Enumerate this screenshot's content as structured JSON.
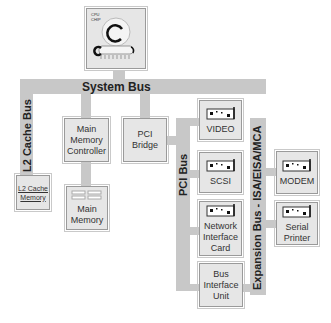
{
  "cpu": {
    "label": "CPU\nCHIP"
  },
  "buses": {
    "system": "System Bus",
    "l2cache": "L2 Cache Bus",
    "pci": "PCI Bus",
    "expansion": "Expansion Bus - ISA/EISA/MCA"
  },
  "components": {
    "l2_cache_memory": "L2 Cache\nMemory",
    "main_memory_controller": "Main\nMemory\nController",
    "main_memory": "Main\nMemory",
    "pci_bridge": "PCI\nBridge",
    "video": "VIDEO",
    "scsi": "SCSI",
    "network_interface_card": "Network\nInterface\nCard",
    "bus_interface_unit": "Bus\nInterface\nUnit",
    "modem": "MODEM",
    "serial_printer": "Serial\nPrinter"
  },
  "colors": {
    "bus": "#c8c8c8",
    "box": "#e6e6e6",
    "border": "#9a9a9a"
  }
}
